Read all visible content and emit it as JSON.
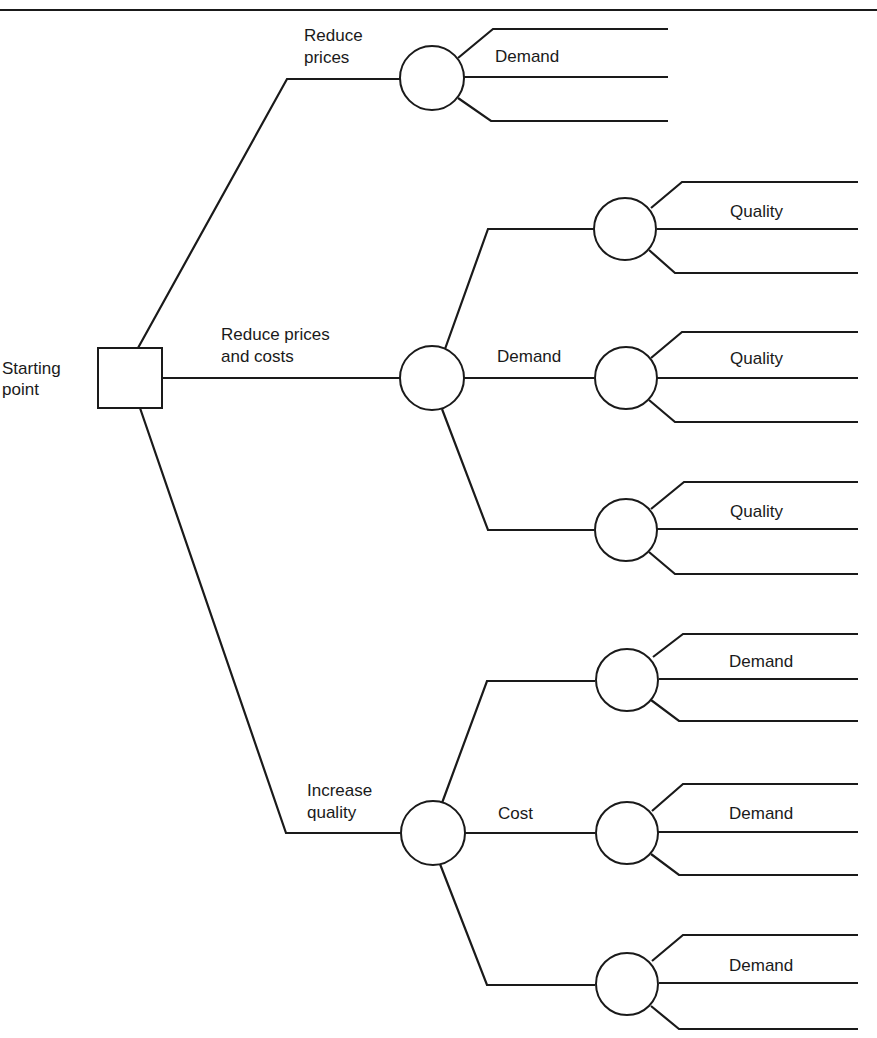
{
  "diagram": {
    "type": "decision-tree",
    "root": {
      "label_lines": [
        "Starting",
        "point"
      ],
      "shape": "square"
    },
    "decisions": [
      {
        "label_lines": [
          "Reduce",
          "prices"
        ],
        "chance_node": {
          "label": "Demand",
          "outcomes": 3
        }
      },
      {
        "label_lines": [
          "Reduce prices",
          "and costs"
        ],
        "chance_node": {
          "label": "Demand",
          "outcomes": 3,
          "sub_nodes": [
            {
              "label": "Quality",
              "outcomes": 3
            },
            {
              "label": "Quality",
              "outcomes": 3
            },
            {
              "label": "Quality",
              "outcomes": 3
            }
          ]
        }
      },
      {
        "label_lines": [
          "Increase",
          "quality"
        ],
        "chance_node": {
          "label": "Cost",
          "outcomes": 3,
          "sub_nodes": [
            {
              "label": "Demand",
              "outcomes": 3
            },
            {
              "label": "Demand",
              "outcomes": 3
            },
            {
              "label": "Demand",
              "outcomes": 3
            }
          ]
        }
      }
    ]
  },
  "colors": {
    "line": "#1a1a1a",
    "background": "#ffffff"
  }
}
